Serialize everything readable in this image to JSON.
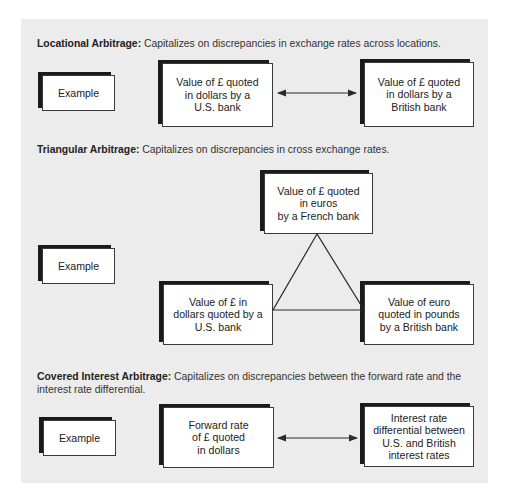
{
  "sections": [
    {
      "title": "Locational Arbitrage:",
      "description": " Capitalizes on discrepancies in exchange rates across locations.",
      "example_label": "Example",
      "boxes": [
        "Value of £ quoted\nin dollars by a\nU.S. bank",
        "Value of £ quoted\nin dollars by a\nBritish bank"
      ]
    },
    {
      "title": "Triangular Arbitrage:",
      "description": " Capitalizes on discrepancies in cross exchange rates.",
      "example_label": "Example",
      "boxes": [
        "Value of £ quoted\nin euros\nby a French bank",
        "Value of £ in\ndollars quoted by a\nU.S. bank",
        "Value of euro\nquoted in pounds\nby a British bank"
      ]
    },
    {
      "title": "Covered Interest Arbitrage:",
      "description": " Capitalizes on discrepancies between the forward rate and the interest rate differential.",
      "example_label": "Example",
      "boxes": [
        "Forward rate\nof £ quoted\nin dollars",
        "Interest rate\ndifferential between\nU.S. and British\ninterest rates"
      ]
    }
  ],
  "colors": {
    "panel_bg": "#ececec",
    "box_bg": "#ffffff",
    "shadow": "#1a1a1a",
    "line": "#2a2a2a"
  }
}
